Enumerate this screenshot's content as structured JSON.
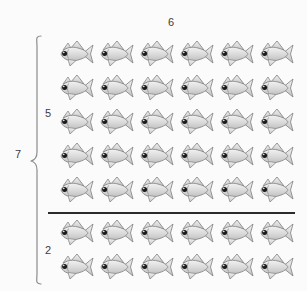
{
  "diagram": {
    "type": "array-model",
    "columns": 6,
    "column_label": "6",
    "total_rows": 7,
    "total_label": "7",
    "groups": [
      {
        "name": "top-group",
        "label": "5",
        "rows": 5
      },
      {
        "name": "bottom-group",
        "label": "2",
        "rows": 2
      }
    ],
    "divider": {
      "present": true,
      "color": "#2b2b2b"
    },
    "brace": {
      "side": "left",
      "spans_rows": 7,
      "color": "#777777"
    },
    "icon": {
      "name": "fish-icon",
      "facing": "left",
      "body_color": "#d9d9d9",
      "outline_color": "#8a8a8a",
      "eye_color": "#1a1a1a",
      "highlight_color": "#f2f2f2"
    },
    "background_color": "#fbfbfb",
    "text_color": "#3c3c3c",
    "top_strip_text": ""
  }
}
